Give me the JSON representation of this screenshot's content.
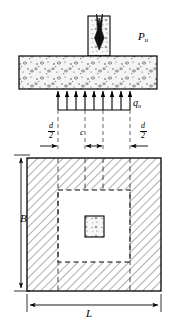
{
  "figure": {
    "views": {
      "elevation": {
        "name": "elevation-view",
        "column": {
          "name": "column",
          "material": "concrete"
        },
        "footing": {
          "name": "footing-slab",
          "material": "concrete"
        }
      },
      "plan": {
        "name": "plan-view",
        "hatch": "45-degree-crosshatch",
        "critical_perimeter": "dashed-square",
        "column_section": {
          "name": "column-section",
          "material": "concrete"
        }
      }
    }
  },
  "labels": {
    "applied_load": {
      "symbol": "P",
      "subscript": "u",
      "full": "Pu"
    },
    "soil_pressure": {
      "symbol": "q",
      "subscript": "u",
      "full": "qu"
    },
    "column_width": "c",
    "footing_width": "B",
    "footing_length": "L",
    "offset_left": {
      "numerator": "d",
      "denominator": "2"
    },
    "offset_right": {
      "numerator": "d",
      "denominator": "2"
    }
  },
  "colors": {
    "line": "#000000",
    "hatch": "#9a9a9a",
    "concrete_fill": "#f2f2f2",
    "background": "#ffffff",
    "dimension": "#000000"
  },
  "arrows": {
    "load_direction": "down",
    "pressure_direction": "up",
    "pressure_arrow_count": 8
  }
}
